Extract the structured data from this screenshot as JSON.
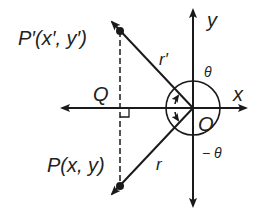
{
  "diagram": {
    "labels": {
      "p_prime": "P′(x′, y′)",
      "p": "P(x, y)",
      "q": "Q",
      "origin": "O",
      "x_axis": "x",
      "y_axis": "y",
      "r_prime": "r′",
      "r": "r",
      "theta": "θ",
      "neg_theta": "− θ"
    },
    "colors": {
      "stroke": "#1a1a1a",
      "background": "#ffffff"
    }
  }
}
